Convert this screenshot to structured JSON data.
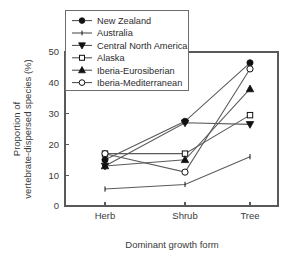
{
  "chart_data": {
    "type": "line",
    "title": "",
    "xlabel": "Dominant growth form",
    "ylabel": "Proportion of vertebrate-dispersed species (%)",
    "ylabel_line1": "Proportion of",
    "ylabel_line2": "vertebrate-dispersed species (%)",
    "categories": [
      "Herb",
      "Shrub",
      "Tree"
    ],
    "ylim": [
      0,
      50
    ],
    "yticks": [
      0,
      10,
      20,
      30,
      40,
      50
    ],
    "ytick_labels": [
      "0",
      "10",
      "20",
      "30",
      "40",
      "50"
    ],
    "grid": false,
    "legend_position": "top-left",
    "series": [
      {
        "name": "New Zealand",
        "marker": "filled-circle",
        "color": "#111111",
        "values": [
          15.0,
          27.5,
          46.5
        ]
      },
      {
        "name": "Australia",
        "marker": "plus-tick",
        "color": "#111111",
        "values": [
          5.5,
          7.0,
          16.0
        ]
      },
      {
        "name": "Central North America",
        "marker": "filled-down-triangle",
        "color": "#111111",
        "values": [
          13.0,
          27.0,
          26.5
        ]
      },
      {
        "name": "Alaska",
        "marker": "open-square",
        "color": "#111111",
        "values": [
          17.0,
          17.0,
          29.5
        ]
      },
      {
        "name": "Iberia-Eurosiberian",
        "marker": "filled-up-triangle",
        "color": "#111111",
        "values": [
          13.0,
          15.0,
          38.0
        ]
      },
      {
        "name": "Iberia-Mediterranean",
        "marker": "open-circle",
        "color": "#111111",
        "values": [
          17.0,
          11.0,
          44.5
        ]
      }
    ]
  }
}
